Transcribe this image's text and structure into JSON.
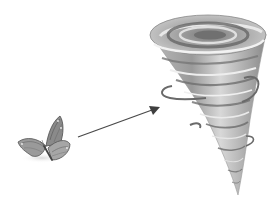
{
  "illustration": {
    "caption": "Butterfly effect illustration: a butterfly with an arrow pointing to a tornado",
    "elements": [
      {
        "name": "butterfly",
        "icon": "butterfly-icon"
      },
      {
        "name": "arrow",
        "icon": "arrow-right-icon"
      },
      {
        "name": "tornado",
        "icon": "tornado-icon"
      }
    ],
    "colors": {
      "background": "#ffffff",
      "dark": "#5a5a5a",
      "mid": "#8c8c8c",
      "light": "#c8c8c8",
      "arrow": "#4a4a4a"
    }
  }
}
